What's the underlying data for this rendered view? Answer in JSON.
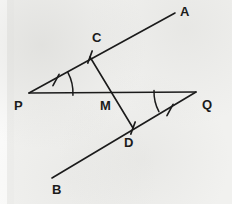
{
  "figure": {
    "background_color": "#f1f1ef",
    "ink_color": "#1b1b1b",
    "stroke_width": 1.6,
    "width": 232,
    "height": 204
  },
  "points": [
    {
      "id": "A",
      "label": "A",
      "x": 175,
      "y": 13,
      "label_x": 180,
      "label_y": 5,
      "kind": "ray-endpoint"
    },
    {
      "id": "C",
      "label": "C",
      "x": 90,
      "y": 57,
      "label_x": 92,
      "label_y": 31,
      "kind": "intersection"
    },
    {
      "id": "P",
      "label": "P",
      "x": 29,
      "y": 93,
      "label_x": 14,
      "label_y": 99,
      "kind": "vertex"
    },
    {
      "id": "M",
      "label": "M",
      "x": 112,
      "y": 93,
      "label_x": 100,
      "label_y": 99,
      "kind": "midpoint"
    },
    {
      "id": "Q",
      "label": "Q",
      "x": 196,
      "y": 92,
      "label_x": 202,
      "label_y": 98,
      "kind": "vertex"
    },
    {
      "id": "D",
      "label": "D",
      "x": 133,
      "y": 128,
      "label_x": 124,
      "label_y": 136,
      "kind": "intersection"
    },
    {
      "id": "B",
      "label": "B",
      "x": 52,
      "y": 178,
      "label_x": 52,
      "label_y": 183,
      "kind": "ray-endpoint"
    }
  ],
  "segments": [
    {
      "id": "PA",
      "label": "ray PA through C to A",
      "x1": 29,
      "y1": 93,
      "x2": 175,
      "y2": 13
    },
    {
      "id": "PQ",
      "label": "line PQ through M",
      "x1": 29,
      "y1": 93,
      "x2": 196,
      "y2": 92
    },
    {
      "id": "BQ",
      "label": "ray B through D to Q",
      "x1": 52,
      "y1": 178,
      "x2": 196,
      "y2": 92
    },
    {
      "id": "CD",
      "label": "segment CD through M",
      "x1": 90,
      "y1": 57,
      "x2": 133,
      "y2": 128
    }
  ],
  "tick_marks": [
    {
      "id": "tick-PC",
      "label": "single tick on PC",
      "x": 56,
      "y": 80,
      "angle": 118
    },
    {
      "id": "tick-C",
      "label": "single tick at C",
      "x": 90,
      "y": 57,
      "angle": 110
    },
    {
      "id": "tick-D",
      "label": "single tick at D",
      "x": 133,
      "y": 128,
      "angle": 110
    },
    {
      "id": "tick-Q",
      "label": "single tick on DQ",
      "x": 170,
      "y": 110,
      "angle": 118
    }
  ],
  "angle_arcs": [
    {
      "id": "arc-P",
      "label": "angle at P",
      "cx": 29,
      "cy": 93,
      "r": 44,
      "start": -28,
      "end": 3,
      "sweep": "ccw"
    },
    {
      "id": "arc-Q",
      "label": "angle at Q",
      "cx": 196,
      "cy": 92,
      "r": 42,
      "start": 152,
      "end": 182,
      "sweep": "cw"
    }
  ],
  "legend": {
    "equal_segments_note": "CM = MD (single ticks)",
    "equal_angles_note": "angle P = angle Q (single arcs)"
  }
}
